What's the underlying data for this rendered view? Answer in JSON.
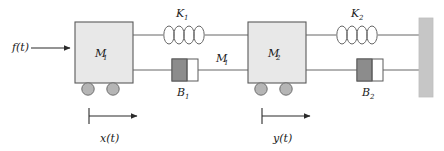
{
  "diagram": {
    "background_color": "#ffffff",
    "line_color": "#555555",
    "body_fill": "#e8e8e8",
    "body_stroke": "#5a5a5a",
    "wheel_fill": "#b5b5b5",
    "wheel_stroke": "#6e6e6e",
    "piston_fill": "#8c8c8c",
    "cylinder_fill": "#ffffff",
    "wall_fill": "#c6c6c6",
    "text_color": "#1a1a1a"
  },
  "labels": {
    "force": {
      "base": "f",
      "arg": "(t)",
      "full": "f(t)"
    },
    "mass1": {
      "base": "M",
      "sub": "1",
      "full": "M1"
    },
    "mass2": {
      "base": "M",
      "sub": "2",
      "full": "M2"
    },
    "rod_label": {
      "base": "M",
      "sub": "1",
      "full": "M1"
    },
    "spring1": {
      "base": "K",
      "sub": "1",
      "full": "K1"
    },
    "spring2": {
      "base": "K",
      "sub": "2",
      "full": "K2"
    },
    "damper1": {
      "base": "B",
      "sub": "1",
      "full": "B1"
    },
    "damper2": {
      "base": "B",
      "sub": "2",
      "full": "B2"
    },
    "displacement1": {
      "base": "x",
      "arg": "(t)",
      "full": "x(t)"
    },
    "displacement2": {
      "base": "y",
      "arg": "(t)",
      "full": "y(t)"
    }
  },
  "components": {
    "force_arrow": {
      "name": "input force arrow",
      "direction": "right"
    },
    "mass1_block": {
      "name": "mass M1 block",
      "wheels": 2
    },
    "mass2_block": {
      "name": "mass M2 block",
      "wheels": 2
    },
    "spring1": {
      "name": "spring K1",
      "coils": 4
    },
    "spring2": {
      "name": "spring K2",
      "coils": 4
    },
    "damper1": {
      "name": "damper B1"
    },
    "damper2": {
      "name": "damper B2"
    },
    "wall": {
      "name": "fixed wall"
    },
    "x_arrow": {
      "name": "displacement x(t) arrow",
      "direction": "right"
    },
    "y_arrow": {
      "name": "displacement y(t) arrow",
      "direction": "right"
    }
  }
}
